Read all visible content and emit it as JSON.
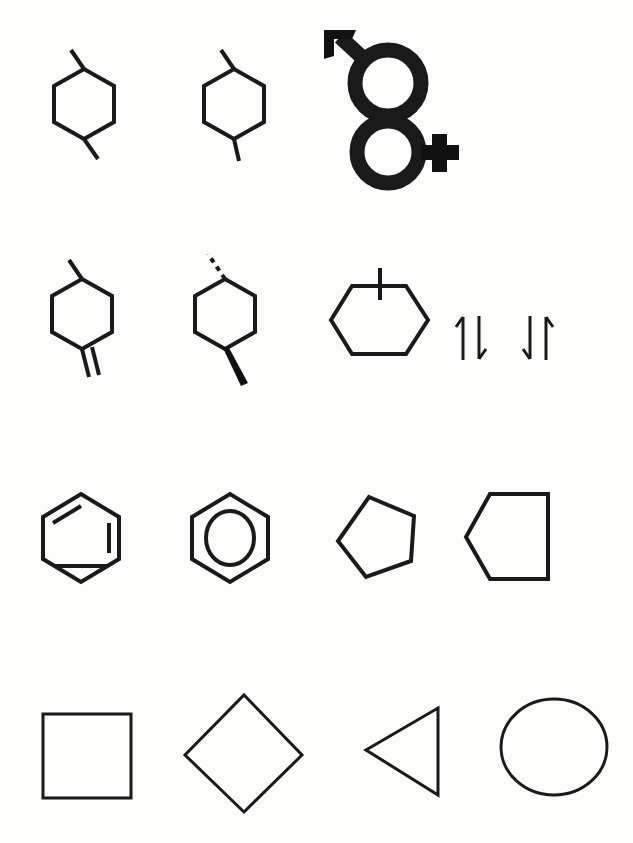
{
  "page": {
    "background_color": "#fdfdfc",
    "ink_color": "#1a1a1a",
    "width": 633,
    "height": 843,
    "rows": 4,
    "glyph_count": 15
  },
  "rows": [
    {
      "index": 1,
      "label": "row-1-cyclohexanes-and-gender-symbol",
      "items": [
        {
          "name": "trans-1,4-dimethylcyclohexane",
          "icon": "hexagon-two-methyl-icon",
          "description": "Hexagon ring with a plain methyl line at the top-left vertex and a plain methyl line at the bottom-right vertex",
          "stroke_width": 4
        },
        {
          "name": "cis-1,4-dimethylcyclohexane",
          "icon": "hexagon-two-methyl-alt-icon",
          "description": "Hexagon ring with a methyl line at the top-left vertex and a methyl line descending from the lower-right vertex",
          "stroke_width": 4
        },
        {
          "name": "male-female-combined-symbol",
          "icon": "male-female-symbol-icon",
          "description": "Solid black male symbol (circle with upper-left arrow) stacked above a circle bearing a plus sign on its right side",
          "stroke_width": 15
        }
      ]
    },
    {
      "index": 2,
      "label": "row-2-substituted-rings-and-spin-arrows",
      "items": [
        {
          "name": "methylcyclohexene-exocyclic-double-bond",
          "icon": "hexagon-methyl-double-bond-icon",
          "description": "Hexagon with a methyl line at the top-left vertex and an exocyclic double bond (two parallel lines) at the bottom-right vertex",
          "stroke_width": 4
        },
        {
          "name": "stereochemistry-dimethylcyclohexane",
          "icon": "hexagon-wedge-dash-icon",
          "description": "Hexagon with a hashed (dashed) bond at the top-left vertex and a bold solid wedge bond at the bottom-right vertex",
          "stroke_width": 4
        },
        {
          "name": "methylcyclohexane-vertical-bond",
          "icon": "hexagon-flat-top-vertical-line-icon",
          "description": "Flat-top hexagon with a short vertical line crossing the top edge",
          "stroke_width": 4
        },
        {
          "name": "paired-spin-up-down",
          "icon": "arrow-up-down-pair-icon",
          "description": "Electron spin pair: one arrow pointing up beside one arrow pointing down",
          "glyph": "↑↓",
          "stroke_width": 3
        },
        {
          "name": "paired-spin-down-up",
          "icon": "arrow-down-up-pair-icon",
          "description": "Electron spin pair: one arrow pointing down beside one arrow pointing up",
          "glyph": "↓↑",
          "stroke_width": 3
        }
      ]
    },
    {
      "index": 3,
      "label": "row-3-aromatic-rings-and-pentagons",
      "items": [
        {
          "name": "benzene-kekule",
          "icon": "benzene-kekule-icon",
          "description": "Hexagon with three inner parallel lines indicating alternating double bonds",
          "stroke_width": 4
        },
        {
          "name": "benzene-circle",
          "icon": "benzene-circle-icon",
          "description": "Hexagon enclosing a circle, denoting aromatic delocalisation",
          "stroke_width": 4
        },
        {
          "name": "cyclopentane-left-vertex",
          "icon": "pentagon-left-vertex-icon",
          "description": "Regular pentagon rotated so a vertex points to the left",
          "stroke_width": 4
        },
        {
          "name": "pentagon-flat-right-edge",
          "icon": "pentagon-flat-right-icon",
          "description": "Pentagon with a flat vertical right edge and a vertex pointing left",
          "stroke_width": 4
        }
      ]
    },
    {
      "index": 4,
      "label": "row-4-basic-geometric-shapes",
      "items": [
        {
          "name": "square",
          "icon": "square-icon",
          "description": "Upright open square",
          "stroke_width": 3
        },
        {
          "name": "diamond",
          "icon": "diamond-icon",
          "description": "Square rotated 45 degrees, a diamond/rhombus outline",
          "stroke_width": 3
        },
        {
          "name": "left-pointing-triangle",
          "icon": "triangle-left-icon",
          "description": "Triangle with a vertical right edge and an apex pointing left",
          "stroke_width": 3
        },
        {
          "name": "circle",
          "icon": "circle-icon",
          "description": "Open circle outline",
          "stroke_width": 3
        }
      ]
    }
  ]
}
